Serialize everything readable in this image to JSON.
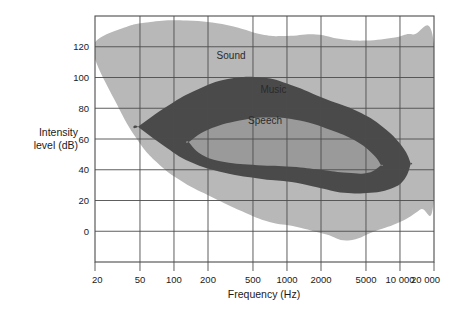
{
  "chart_data": {
    "type": "area",
    "title": "",
    "subtitle": "",
    "xlabel": "Frequency (Hz)",
    "ylabel": "Intensity level (dB)",
    "ylabel_line1": "Intensity",
    "ylabel_line2": "level (dB)",
    "x_scale": "log",
    "xlim": [
      20,
      20000
    ],
    "ylim": [
      -20,
      140
    ],
    "grid": true,
    "legend_position": "inline-annotations",
    "x_ticks": [
      {
        "value": 20,
        "label": "20"
      },
      {
        "value": 50,
        "label": "50"
      },
      {
        "value": 100,
        "label": "100"
      },
      {
        "value": 200,
        "label": "200"
      },
      {
        "value": 500,
        "label": "500"
      },
      {
        "value": 1000,
        "label": "1000"
      },
      {
        "value": 2000,
        "label": "2000"
      },
      {
        "value": 5000,
        "label": "5000"
      },
      {
        "value": 10000,
        "label": "10 000"
      },
      {
        "value": 20000,
        "label": "20 000"
      }
    ],
    "y_ticks": [
      {
        "value": 0,
        "label": "0"
      },
      {
        "value": 20,
        "label": "20"
      },
      {
        "value": 40,
        "label": "40"
      },
      {
        "value": 60,
        "label": "60"
      },
      {
        "value": 80,
        "label": "80"
      },
      {
        "value": 100,
        "label": "100"
      },
      {
        "value": 120,
        "label": "120"
      }
    ],
    "series": [
      {
        "name": "Sound",
        "label": "Sound",
        "color": "#b8b8b8",
        "description": "Total range of audible sound (threshold of hearing to threshold of pain)",
        "label_point": {
          "freq": 320,
          "level": 112
        },
        "boundary_upper": [
          {
            "freq": 20,
            "level": 123
          },
          {
            "freq": 35,
            "level": 132
          },
          {
            "freq": 60,
            "level": 136
          },
          {
            "freq": 130,
            "level": 137
          },
          {
            "freq": 300,
            "level": 134
          },
          {
            "freq": 600,
            "level": 128
          },
          {
            "freq": 1000,
            "level": 127
          },
          {
            "freq": 1800,
            "level": 128
          },
          {
            "freq": 3000,
            "level": 125
          },
          {
            "freq": 5000,
            "level": 124
          },
          {
            "freq": 9000,
            "level": 126
          },
          {
            "freq": 13000,
            "level": 128
          },
          {
            "freq": 20000,
            "level": 122
          }
        ],
        "boundary_lower": [
          {
            "freq": 20,
            "level": 112
          },
          {
            "freq": 30,
            "level": 85
          },
          {
            "freq": 45,
            "level": 62
          },
          {
            "freq": 70,
            "level": 45
          },
          {
            "freq": 120,
            "level": 32
          },
          {
            "freq": 220,
            "level": 22
          },
          {
            "freq": 400,
            "level": 13
          },
          {
            "freq": 700,
            "level": 6
          },
          {
            "freq": 1200,
            "level": 3
          },
          {
            "freq": 2200,
            "level": -2
          },
          {
            "freq": 3500,
            "level": -6
          },
          {
            "freq": 6000,
            "level": 0
          },
          {
            "freq": 10000,
            "level": 6
          },
          {
            "freq": 15000,
            "level": 14
          },
          {
            "freq": 20000,
            "level": 22
          }
        ]
      },
      {
        "name": "Music",
        "label": "Music",
        "color": "#4a4a4a",
        "description": "Dynamic range of music",
        "label_point": {
          "freq": 760,
          "level": 90
        },
        "boundary_upper": [
          {
            "freq": 48,
            "level": 68
          },
          {
            "freq": 90,
            "level": 82
          },
          {
            "freq": 160,
            "level": 92
          },
          {
            "freq": 300,
            "level": 99
          },
          {
            "freq": 600,
            "level": 100
          },
          {
            "freq": 1100,
            "level": 95
          },
          {
            "freq": 2200,
            "level": 86
          },
          {
            "freq": 4200,
            "level": 78
          },
          {
            "freq": 7000,
            "level": 68
          },
          {
            "freq": 10500,
            "level": 55
          },
          {
            "freq": 12500,
            "level": 44
          }
        ],
        "boundary_lower": [
          {
            "freq": 48,
            "level": 68
          },
          {
            "freq": 80,
            "level": 56
          },
          {
            "freq": 140,
            "level": 45
          },
          {
            "freq": 280,
            "level": 38
          },
          {
            "freq": 600,
            "level": 34
          },
          {
            "freq": 1100,
            "level": 32
          },
          {
            "freq": 2000,
            "level": 28
          },
          {
            "freq": 3200,
            "level": 25
          },
          {
            "freq": 5500,
            "level": 25
          },
          {
            "freq": 8500,
            "level": 28
          },
          {
            "freq": 11000,
            "level": 34
          },
          {
            "freq": 12500,
            "level": 44
          }
        ]
      },
      {
        "name": "Speech",
        "label": "Speech",
        "color": "#9a9a9a",
        "description": "Dynamic range of speech",
        "label_point": {
          "freq": 640,
          "level": 70
        },
        "boundary_upper": [
          {
            "freq": 135,
            "level": 58
          },
          {
            "freq": 200,
            "level": 66
          },
          {
            "freq": 380,
            "level": 72
          },
          {
            "freq": 700,
            "level": 74
          },
          {
            "freq": 1300,
            "level": 72
          },
          {
            "freq": 2400,
            "level": 66
          },
          {
            "freq": 4000,
            "level": 59
          },
          {
            "freq": 5800,
            "level": 50
          },
          {
            "freq": 6800,
            "level": 43
          }
        ],
        "boundary_lower": [
          {
            "freq": 135,
            "level": 58
          },
          {
            "freq": 175,
            "level": 50
          },
          {
            "freq": 280,
            "level": 45
          },
          {
            "freq": 550,
            "level": 43
          },
          {
            "freq": 1100,
            "level": 42
          },
          {
            "freq": 2000,
            "level": 40
          },
          {
            "freq": 3400,
            "level": 38
          },
          {
            "freq": 5200,
            "level": 38
          },
          {
            "freq": 6800,
            "level": 43
          }
        ]
      }
    ]
  },
  "axes": {
    "x_title": "Frequency (Hz)",
    "y_title_line1": "Intensity",
    "y_title_line2": "level (dB)"
  },
  "colors": {
    "sound_fill": "#b8b8b8",
    "music_fill": "#4a4a4a",
    "speech_fill": "#9a9a9a",
    "grid": "#4c4c4c",
    "frame": "#4c4c4c",
    "text": "#1a1a1a",
    "background": "#ffffff"
  }
}
